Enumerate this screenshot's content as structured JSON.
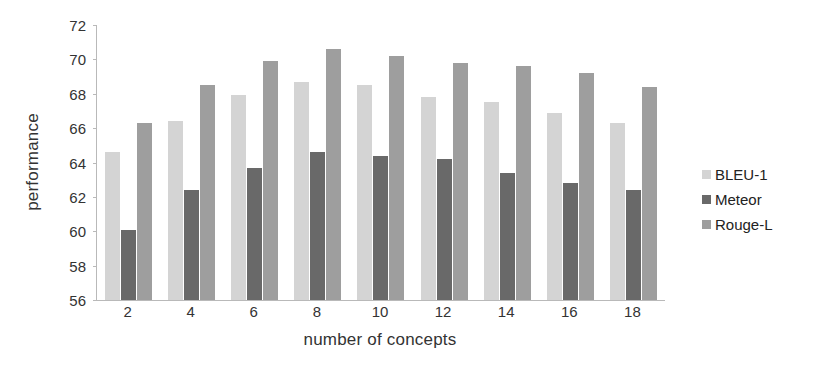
{
  "chart_data": {
    "type": "bar",
    "title": "",
    "xlabel": "number of concepts",
    "ylabel": "performance",
    "categories": [
      "2",
      "4",
      "6",
      "8",
      "10",
      "12",
      "14",
      "16",
      "18"
    ],
    "ylim": [
      56,
      72
    ],
    "yticks": [
      "56",
      "58",
      "60",
      "62",
      "64",
      "66",
      "68",
      "70",
      "72"
    ],
    "grid": false,
    "legend_position": "right",
    "series": [
      {
        "name": "BLEU-1",
        "color": "#d4d4d4",
        "values": [
          64.6,
          66.4,
          67.9,
          68.7,
          68.5,
          67.8,
          67.5,
          66.9,
          66.3
        ]
      },
      {
        "name": "Meteor",
        "color": "#696969",
        "values": [
          60.1,
          62.4,
          63.7,
          64.6,
          64.4,
          64.2,
          63.4,
          62.8,
          62.4
        ]
      },
      {
        "name": "Rouge-L",
        "color": "#9e9e9e",
        "values": [
          66.3,
          68.5,
          69.9,
          70.6,
          70.2,
          69.8,
          69.6,
          69.2,
          68.4
        ]
      }
    ]
  }
}
